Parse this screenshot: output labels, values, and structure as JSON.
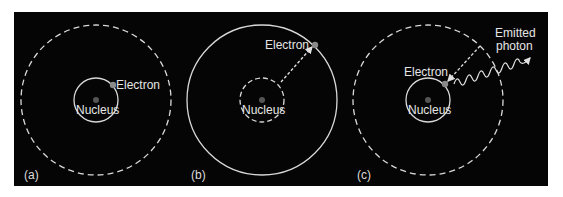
{
  "figure": {
    "panels": [
      {
        "id": "a",
        "panel_label": "(a)",
        "nucleus_label": "Nucleus",
        "electron_label": "Electron",
        "inner_orbit_style": "solid",
        "outer_orbit_style": "dashed",
        "electron_orbit": "inner"
      },
      {
        "id": "b",
        "panel_label": "(b)",
        "nucleus_label": "Nucleus",
        "electron_label": "Electron",
        "inner_orbit_style": "dashed",
        "outer_orbit_style": "solid",
        "electron_orbit": "outer",
        "transition": "excitation (dashed arrow outward)"
      },
      {
        "id": "c",
        "panel_label": "(c)",
        "nucleus_label": "Nucleus",
        "electron_label": "Electron",
        "photon_label_line1": "Emitted",
        "photon_label_line2": "photon",
        "inner_orbit_style": "solid",
        "outer_orbit_style": "dashed",
        "electron_orbit": "inner",
        "transition": "de-excitation (dashed arrow inward) with emitted photon"
      }
    ],
    "colors": {
      "background": "#050505",
      "orbit": "#d9d9d9",
      "nucleus": "#555555",
      "electron": "#8a8a8a",
      "text": "#e6e6e6"
    }
  }
}
